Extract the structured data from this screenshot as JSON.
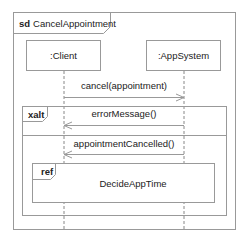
{
  "diagram": {
    "type": "UML sequence diagram",
    "frame": {
      "keyword": "sd",
      "name": "CancelAppointment"
    },
    "lifelines": [
      {
        "id": "client",
        "label": ":Client"
      },
      {
        "id": "appsystem",
        "label": ":AppSystem"
      }
    ],
    "messages": [
      {
        "label": "cancel(appointment)",
        "from": "client",
        "to": "appsystem"
      },
      {
        "label": "errorMessage()",
        "from": "appsystem",
        "to": "client"
      },
      {
        "label": "appointmentCancelled()",
        "from": "appsystem",
        "to": "client"
      }
    ],
    "fragments": [
      {
        "keyword": "xalt"
      },
      {
        "keyword": "ref",
        "name": "DecideAppTime"
      }
    ],
    "colors": {
      "line": "#888888",
      "text": "#222222",
      "background": "#ffffff"
    }
  }
}
